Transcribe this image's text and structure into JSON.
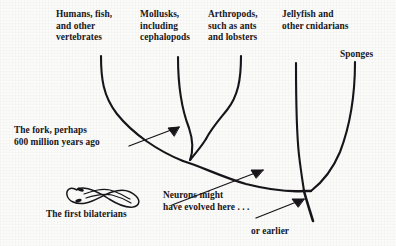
{
  "figure": {
    "ink_color": "#17151a",
    "background_color": "#fbfbfa"
  },
  "tip_labels": [
    {
      "id": "humans",
      "text": "Humans, fish,\nand other\nvertebrates"
    },
    {
      "id": "mollusks",
      "text": "Mollusks,\nincluding\ncephalopods"
    },
    {
      "id": "arthropods",
      "text": "Arthropods,\nsuch as ants\nand lobsters"
    },
    {
      "id": "jellyfish",
      "text": "Jellyfish and\nother cnidarians"
    },
    {
      "id": "sponges",
      "text": "Sponges"
    }
  ],
  "annotations": [
    {
      "id": "fork",
      "text": "The fork, perhaps\n600 million years ago"
    },
    {
      "id": "bilaterians",
      "text": "The first bilaterians"
    },
    {
      "id": "neurons",
      "text": "Neurons might\nhave evolved here . . ."
    },
    {
      "id": "earlier",
      "text": "or earlier"
    }
  ],
  "icons": {
    "worm": "bilaterian-worm-drawing",
    "arrow_fork": "arrow-pointing-to-fork",
    "arrow_neurons": "arrow-pointing-to-neuron-node",
    "arrow_earlier": "arrow-pointing-to-root-node"
  }
}
